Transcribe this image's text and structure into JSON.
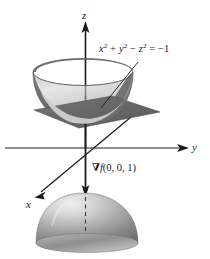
{
  "figure": {
    "kind": "3d-surface-diagram",
    "background_color": "#ffffff",
    "ink_color": "#1a1a1a"
  },
  "axes": {
    "z": {
      "label": "z",
      "direction": "up",
      "arrow": true
    },
    "y": {
      "label": "y",
      "direction": "right",
      "arrow": true
    },
    "x": {
      "label": "x",
      "direction": "down-left",
      "arrow": true
    }
  },
  "annotations": {
    "surface_equation": {
      "full_text": "x² + y² − z² = −1",
      "lhs_terms": [
        "x",
        "2",
        "+",
        "y",
        "2",
        "−",
        "z",
        "2"
      ],
      "x_var": "x",
      "y_var": "y",
      "z_var": "z",
      "exp": "2",
      "plus": "+",
      "minus": "−",
      "equals": "=",
      "rhs": "−1",
      "leader_line": true
    },
    "gradient_vector": {
      "full_text": "∇f(0, 0, 1)",
      "symbol": "∇",
      "function_name": "f",
      "point": "(0, 0, 1)",
      "direction": "downward"
    }
  },
  "surfaces": [
    {
      "name": "upper-sheet",
      "shape": "bowl",
      "note": "upper nappe of the hyperboloid, opening upward, vertex at (0,0,1)",
      "fill_outer": "#6f6f6f",
      "fill_inner": "#d9d9d9"
    },
    {
      "name": "tangent-plane",
      "shape": "parallelogram",
      "note": "horizontal tangent plane at z = 1",
      "fill": "#6a6a6a"
    },
    {
      "name": "lower-sheet",
      "shape": "dome",
      "note": "lower nappe of the hyperboloid, opening downward, vertex at (0,0,-1)",
      "fill": "#8a8a8a"
    }
  ],
  "colors": {
    "ink": "#1a1a1a",
    "plane_gray": "#6a6a6a",
    "surface_dark": "#6f6f6f",
    "surface_light": "#dedede",
    "dome_gray": "#8e8e8e"
  }
}
